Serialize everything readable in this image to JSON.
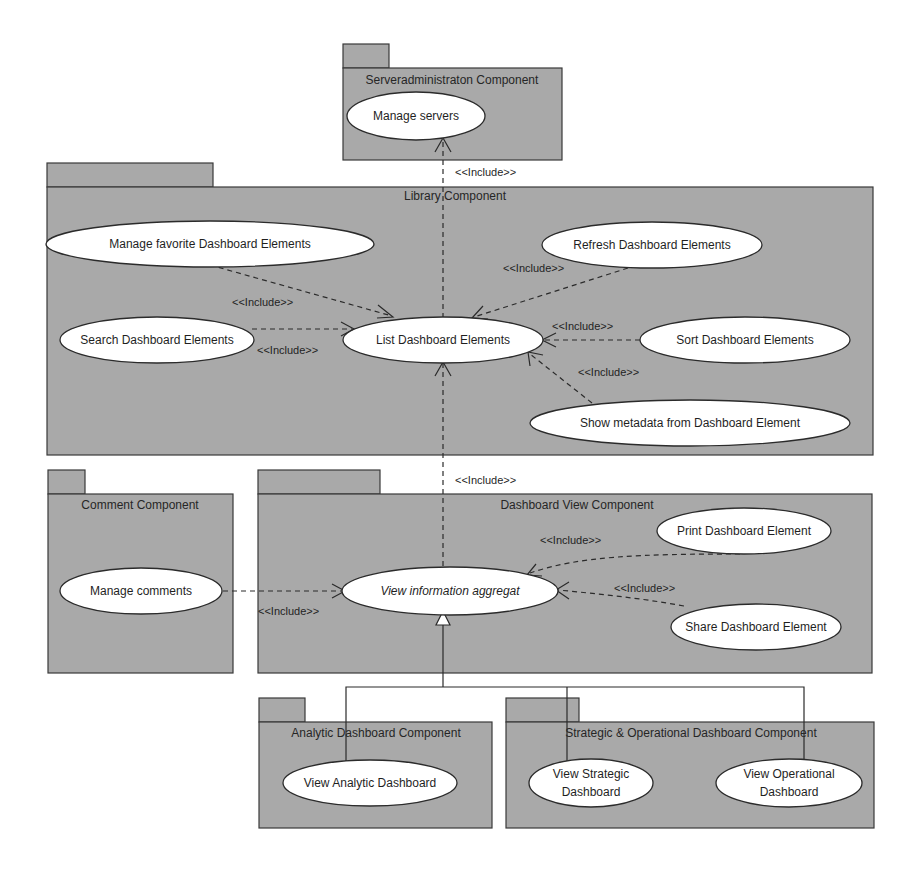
{
  "diagram": {
    "type": "UML use case diagram",
    "colors": {
      "package_fill": "#a9a9a9",
      "usecase_fill": "#ffffff",
      "stroke": "#2b2b2b",
      "background": "#ffffff"
    },
    "include_label": "<<Include>>",
    "packages": {
      "serveradmin": {
        "title": "Serveradministraton Component"
      },
      "library": {
        "title": "Library Component"
      },
      "comment": {
        "title": "Comment Component"
      },
      "dashboard_view": {
        "title": "Dashboard View Component"
      },
      "analytic": {
        "title": "Analytic Dashboard Component"
      },
      "strategic_operational": {
        "title": "Strategic & Operational Dashboard Component"
      }
    },
    "use_cases": {
      "manage_servers": "Manage servers",
      "manage_favorite": "Manage favorite Dashboard Elements",
      "refresh": "Refresh Dashboard Elements",
      "search": "Search Dashboard Elements",
      "list": "List Dashboard Elements",
      "sort": "Sort Dashboard Elements",
      "show_metadata": "Show metadata from Dashboard Element",
      "manage_comments": "Manage comments",
      "view_info_aggregat": "View information aggregat",
      "print": "Print Dashboard Element",
      "share": "Share Dashboard Element",
      "view_analytic": "View Analytic Dashboard",
      "view_strategic_l1": "View Strategic",
      "view_strategic_l2": "Dashboard",
      "view_operational_l1": "View Operational",
      "view_operational_l2": "Dashboard"
    },
    "relations": [
      {
        "from": "List Dashboard Elements",
        "to": "Manage servers",
        "type": "include"
      },
      {
        "from": "Manage favorite Dashboard Elements",
        "to": "List Dashboard Elements",
        "type": "include"
      },
      {
        "from": "Refresh Dashboard Elements",
        "to": "List Dashboard Elements",
        "type": "include"
      },
      {
        "from": "Search Dashboard Elements",
        "to": "List Dashboard Elements",
        "type": "include"
      },
      {
        "from": "Sort Dashboard Elements",
        "to": "List Dashboard Elements",
        "type": "include"
      },
      {
        "from": "Show metadata from Dashboard Element",
        "to": "List Dashboard Elements",
        "type": "include"
      },
      {
        "from": "View information aggregat",
        "to": "List Dashboard Elements",
        "type": "include"
      },
      {
        "from": "Manage comments",
        "to": "View information aggregat",
        "type": "include"
      },
      {
        "from": "Print Dashboard Element",
        "to": "View information aggregat",
        "type": "include"
      },
      {
        "from": "Share Dashboard Element",
        "to": "View information aggregat",
        "type": "include"
      },
      {
        "from": "View Analytic Dashboard",
        "to": "View information aggregat",
        "type": "generalization"
      },
      {
        "from": "View Strategic Dashboard",
        "to": "View information aggregat",
        "type": "generalization"
      },
      {
        "from": "View Operational Dashboard",
        "to": "View information aggregat",
        "type": "generalization"
      }
    ]
  }
}
